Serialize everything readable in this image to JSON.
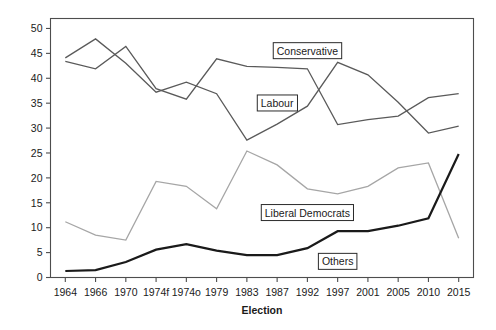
{
  "chart_data": {
    "type": "line",
    "title": "",
    "xlabel": "Election",
    "ylabel": "",
    "categories": [
      "1964",
      "1966",
      "1970",
      "1974f",
      "1974o",
      "1979",
      "1983",
      "1987",
      "1992",
      "1997",
      "2001",
      "2005",
      "2010",
      "2015"
    ],
    "ylim": [
      0,
      52
    ],
    "yticks": [
      0,
      5,
      10,
      15,
      20,
      25,
      30,
      35,
      40,
      45,
      50
    ],
    "ytick_labels": [
      "0",
      "5",
      "10",
      "15",
      "20",
      "25",
      "30",
      "35",
      "40",
      "45",
      "50"
    ],
    "grid": false,
    "legend": "inline-labels",
    "series": [
      {
        "name": "Conservative",
        "color": "#5a5a5a",
        "width": 1.3,
        "label_x": "1992",
        "label_y": 45.5,
        "values": [
          43.4,
          41.9,
          46.4,
          37.9,
          35.8,
          43.9,
          42.4,
          42.2,
          41.9,
          30.7,
          31.7,
          32.4,
          36.1,
          36.9
        ]
      },
      {
        "name": "Labour",
        "color": "#5a5a5a",
        "width": 1.3,
        "label_x": "1987",
        "label_y": 35.0,
        "values": [
          44.1,
          47.9,
          43.0,
          37.2,
          39.2,
          36.9,
          27.6,
          30.8,
          34.4,
          43.2,
          40.7,
          35.2,
          29.0,
          30.4
        ]
      },
      {
        "name": "Liberal Democrats",
        "color": "#a6a6a6",
        "width": 1.3,
        "label_x": "1992",
        "label_y": 13.0,
        "values": [
          11.2,
          8.5,
          7.5,
          19.3,
          18.3,
          13.8,
          25.4,
          22.6,
          17.8,
          16.8,
          18.3,
          22.0,
          23.0,
          7.9
        ]
      },
      {
        "name": "Others",
        "color": "#1a1a1a",
        "width": 2.2,
        "label_x": "1997",
        "label_y": 3.2,
        "values": [
          1.3,
          1.5,
          3.1,
          5.6,
          6.7,
          5.4,
          4.5,
          4.5,
          5.9,
          9.3,
          9.3,
          10.4,
          11.9,
          24.8
        ]
      }
    ]
  },
  "axes": {
    "x_title": "Election",
    "frame_color": "#4d4d4d"
  }
}
